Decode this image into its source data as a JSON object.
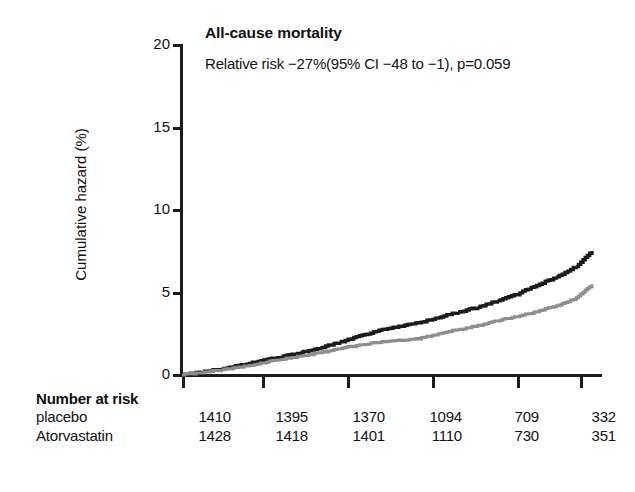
{
  "chart_data": {
    "type": "line",
    "title": "All-cause mortality",
    "subtitle": "Relative risk −27%(95% CI −48 to −1), p=0.059",
    "xlabel": "",
    "ylabel": "Cumulative hazard (%)",
    "ylim": [
      0,
      20
    ],
    "yticks": [
      0,
      5,
      10,
      15,
      20
    ],
    "ytick_labels": [
      "0",
      "5",
      "10",
      "15",
      "20"
    ],
    "xlim": [
      0,
      6
    ],
    "xticks": [
      0,
      1,
      2,
      3,
      4,
      5
    ],
    "xtick_labels": [
      "",
      "",
      "",
      "",
      "",
      ""
    ],
    "grid": false,
    "legend": "none",
    "x": [
      0,
      0.25,
      0.5,
      0.75,
      1,
      1.25,
      1.5,
      1.75,
      2,
      2.25,
      2.5,
      2.75,
      3,
      3.25,
      3.5,
      3.75,
      4,
      4.25,
      4.5,
      4.75,
      5,
      5.2
    ],
    "series": [
      {
        "name": "placebo",
        "color": "#1b1b1b",
        "values": [
          0,
          0.18,
          0.38,
          0.6,
          0.85,
          1.1,
          1.35,
          1.65,
          2.0,
          2.35,
          2.7,
          2.95,
          3.15,
          3.5,
          3.8,
          4.1,
          4.5,
          4.9,
          5.45,
          5.95,
          6.6,
          7.5
        ]
      },
      {
        "name": "Atorvastatin",
        "color": "#8d8d8d",
        "values": [
          0,
          0.15,
          0.3,
          0.5,
          0.72,
          0.95,
          1.15,
          1.35,
          1.6,
          1.8,
          2.0,
          2.1,
          2.2,
          2.5,
          2.75,
          3.0,
          3.3,
          3.55,
          3.85,
          4.2,
          4.65,
          5.5
        ]
      }
    ]
  },
  "risk_table": {
    "title": "Number at risk",
    "rows": [
      {
        "label": "placebo",
        "values": [
          "1410",
          "1395",
          "1370",
          "1094",
          "709",
          "332"
        ]
      },
      {
        "label": "Atorvastatin",
        "values": [
          "1428",
          "1418",
          "1401",
          "1110",
          "730",
          "351"
        ]
      }
    ]
  },
  "colors": {
    "axis": "#1b1b1b",
    "placebo_line": "#1b1b1b",
    "atorvastatin_line": "#8d8d8d",
    "background": "#ffffff",
    "text": "#111111"
  }
}
